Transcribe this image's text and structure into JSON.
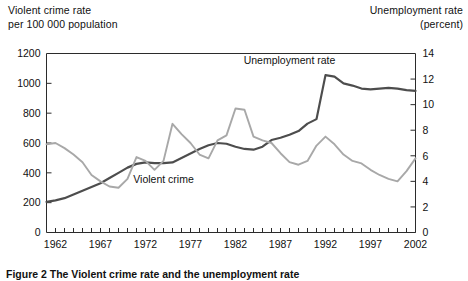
{
  "axis_captions": {
    "left": "Violent crime rate\nper 100 000 population",
    "right": "Unemployment rate\n(percent)"
  },
  "series_labels": {
    "violent_crime": "Violent crime",
    "unemployment": "Unemployment rate"
  },
  "figure_caption": "Figure 2 The Violent crime rate and the unemployment rate",
  "colors": {
    "violent_crime": "#4d4d4d",
    "unemployment": "#a8a8a8",
    "axis": "#2b2b2b",
    "text": "#111111",
    "background": "#ffffff"
  },
  "chart_data": {
    "type": "line",
    "title": "",
    "subtitle": "",
    "xlabel": "",
    "ylabel": "Violent crime rate per 100 000 population",
    "y2label": "Unemployment rate (percent)",
    "grid": false,
    "legend": "inline-labels",
    "xlim": [
      1961,
      2002
    ],
    "ylim": [
      0,
      1200
    ],
    "y2lim": [
      0,
      14
    ],
    "yticks": [
      0,
      200,
      400,
      600,
      800,
      1000,
      1200
    ],
    "y2ticks": [
      0,
      2,
      4,
      6,
      8,
      10,
      12,
      14
    ],
    "xticks_labeled": [
      1962,
      1967,
      1972,
      1977,
      1982,
      1987,
      1992,
      1997,
      2002
    ],
    "xtick_interval_minor": 1,
    "x": [
      1961,
      1962,
      1963,
      1964,
      1965,
      1966,
      1967,
      1968,
      1969,
      1970,
      1971,
      1972,
      1973,
      1974,
      1975,
      1976,
      1977,
      1978,
      1979,
      1980,
      1981,
      1982,
      1983,
      1984,
      1985,
      1986,
      1987,
      1988,
      1989,
      1990,
      1991,
      1992,
      1993,
      1994,
      1995,
      1996,
      1997,
      1998,
      1999,
      2000,
      2001,
      2002
    ],
    "series": [
      {
        "name": "Violent crime",
        "axis": "left",
        "units": "per 100 000 population",
        "color": "#4d4d4d",
        "values": [
          205,
          215,
          230,
          255,
          280,
          305,
          330,
          365,
          400,
          435,
          460,
          470,
          465,
          465,
          470,
          500,
          530,
          560,
          585,
          600,
          595,
          575,
          560,
          555,
          575,
          620,
          635,
          655,
          680,
          730,
          760,
          1055,
          1045,
          1000,
          985,
          965,
          960,
          965,
          970,
          965,
          955,
          950
        ]
      },
      {
        "name": "Unemployment rate",
        "axis": "right",
        "units": "percent",
        "color": "#a8a8a8",
        "values": [
          6.9,
          7.0,
          6.6,
          6.1,
          5.5,
          4.5,
          4.0,
          3.6,
          3.5,
          4.2,
          5.9,
          5.6,
          4.9,
          5.6,
          8.5,
          7.7,
          7.0,
          6.1,
          5.8,
          7.2,
          7.6,
          9.7,
          9.6,
          7.5,
          7.2,
          7.0,
          6.2,
          5.5,
          5.3,
          5.6,
          6.8,
          7.5,
          6.9,
          6.1,
          5.6,
          5.4,
          4.9,
          4.5,
          4.2,
          4.0,
          4.8,
          5.8
        ]
      }
    ],
    "annotations": [
      {
        "text": "Violent crime",
        "x": 1974.0,
        "y": 330,
        "axis": "left"
      },
      {
        "text": "Unemployment rate",
        "x": 1988.0,
        "y": 13.2,
        "axis": "right"
      }
    ]
  }
}
